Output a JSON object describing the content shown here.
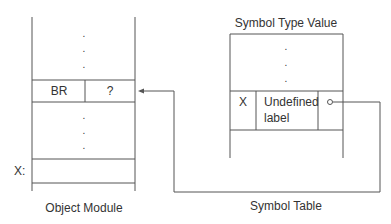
{
  "object_module": {
    "caption": "Object Module",
    "ellipsis_top": ".",
    "ellipsis_bottom": ".",
    "instruction_row": {
      "opcode": "BR",
      "operand": "?"
    },
    "target_label": "X:"
  },
  "symbol_table": {
    "header": "Symbol Type Value",
    "caption": "Symbol Table",
    "ellipsis": ".",
    "entry": {
      "symbol": "X",
      "type_line1": "Undefined",
      "type_line2": "label",
      "value_marker": "o"
    }
  }
}
